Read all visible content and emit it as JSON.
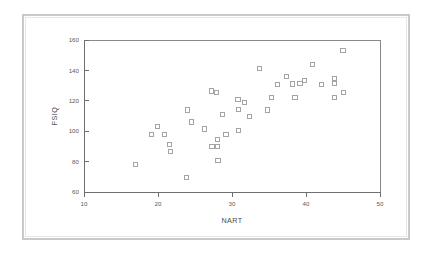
{
  "figure": {
    "background_color": "#ffffff",
    "frame_color": "#c9c9c9",
    "axis_color": "#6f6f6f",
    "marker_color": "#9a9a9a"
  },
  "chart_data": {
    "type": "scatter",
    "title": "",
    "subtitle": "",
    "xlabel": "NART",
    "ylabel": "FSIQ",
    "xlim": [
      10,
      50
    ],
    "ylim": [
      60,
      160
    ],
    "xticks": [
      10,
      20,
      30,
      40,
      50
    ],
    "yticks": [
      60,
      80,
      100,
      120,
      140,
      160
    ],
    "xtick_labels": [
      "10",
      "20",
      "30",
      "40",
      "50"
    ],
    "ytick_labels": [
      "60",
      "80",
      "100",
      "120",
      "140",
      "160"
    ],
    "grid": false,
    "legend": null,
    "legend_position": "none",
    "marker_style": "open-square",
    "series": [
      {
        "name": "subjects",
        "points": [
          [
            17.0,
            78.0
          ],
          [
            19.1,
            98.0
          ],
          [
            19.9,
            103.0
          ],
          [
            20.9,
            98.0
          ],
          [
            21.6,
            91.0
          ],
          [
            21.7,
            86.5
          ],
          [
            23.8,
            69.5
          ],
          [
            24.0,
            114.0
          ],
          [
            24.5,
            106.0
          ],
          [
            26.3,
            101.5
          ],
          [
            27.2,
            126.5
          ],
          [
            27.3,
            90.0
          ],
          [
            27.9,
            125.5
          ],
          [
            28.0,
            94.5
          ],
          [
            28.0,
            90.0
          ],
          [
            28.1,
            80.5
          ],
          [
            28.7,
            111.0
          ],
          [
            29.2,
            98.0
          ],
          [
            30.8,
            121.0
          ],
          [
            30.9,
            114.5
          ],
          [
            30.9,
            100.5
          ],
          [
            31.7,
            119.0
          ],
          [
            32.4,
            109.5
          ],
          [
            33.7,
            141.0
          ],
          [
            34.8,
            114.0
          ],
          [
            35.3,
            122.0
          ],
          [
            36.1,
            130.5
          ],
          [
            37.4,
            136.0
          ],
          [
            38.2,
            131.0
          ],
          [
            38.5,
            122.0
          ],
          [
            39.2,
            131.5
          ],
          [
            39.8,
            133.5
          ],
          [
            40.9,
            144.0
          ],
          [
            42.1,
            130.5
          ],
          [
            43.8,
            134.5
          ],
          [
            43.9,
            131.5
          ],
          [
            43.9,
            122.0
          ],
          [
            45.0,
            153.0
          ],
          [
            45.1,
            125.5
          ]
        ]
      }
    ]
  }
}
